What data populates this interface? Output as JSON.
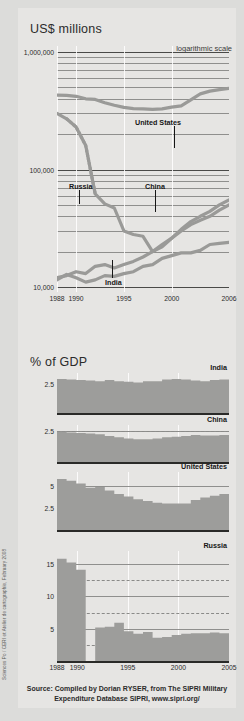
{
  "credit": "Sciences Po / CERI et Atelier de cartographie, February 2008",
  "headings": {
    "usd": "US$ millions",
    "gdp": "% of GDP",
    "log_note": "logarithmic scale"
  },
  "source": {
    "line1": "Source: Compiled by Dorian RYSER, from The SIPRI Military",
    "line2": "Expenditure Database SIPRI, www.sipri.org/"
  },
  "colors": {
    "paper": "#e6e5e3",
    "series_line": "#9a9a98",
    "area_fill": "#9d9d9b",
    "grid": "#8f8f8d",
    "axis": "#2a2a28",
    "text": "#2b2b2b"
  },
  "chart_data": [
    {
      "type": "line",
      "id": "military-expenditure-absolute",
      "title": "US$ millions",
      "annotation": "logarithmic scale",
      "xlabel": "",
      "ylabel": "US$ millions",
      "yscale": "log",
      "ylim": [
        8000,
        1200000
      ],
      "yticks": [
        1000000,
        100000,
        10000
      ],
      "ytick_labels": [
        "1,000,000",
        "100,000",
        "10,000"
      ],
      "xlim": [
        1988,
        2006
      ],
      "xticks": [
        1988,
        1990,
        1995,
        2000,
        2006
      ],
      "xtick_labels": [
        "1988",
        "1990",
        "1995",
        "2000",
        "2006"
      ],
      "grid": true,
      "legend": "inline-labels",
      "series": [
        {
          "name": "United States",
          "x": [
            1988,
            1989,
            1990,
            1991,
            1992,
            1993,
            1994,
            1995,
            1996,
            1997,
            1998,
            1999,
            2000,
            2001,
            2002,
            2003,
            2004,
            2005,
            2006
          ],
          "values": [
            430000,
            428000,
            420000,
            400000,
            395000,
            370000,
            352000,
            338000,
            330000,
            328000,
            325000,
            328000,
            340000,
            348000,
            392000,
            440000,
            465000,
            478000,
            490000
          ]
        },
        {
          "name": "Russia",
          "x": [
            1988,
            1989,
            1990,
            1991,
            1992,
            1993,
            1994,
            1995,
            1996,
            1997,
            1998,
            1999,
            2000,
            2001,
            2002,
            2003,
            2004,
            2005,
            2006
          ],
          "values": [
            300000,
            270000,
            230000,
            160000,
            62000,
            51000,
            47000,
            30000,
            28000,
            27000,
            20000,
            22000,
            26000,
            30000,
            34000,
            37000,
            40000,
            45000,
            50000
          ]
        },
        {
          "name": "China",
          "x": [
            1988,
            1989,
            1990,
            1991,
            1992,
            1993,
            1994,
            1995,
            1996,
            1997,
            1998,
            1999,
            2000,
            2001,
            2002,
            2003,
            2004,
            2005,
            2006
          ],
          "values": [
            12000,
            12500,
            13500,
            13000,
            15000,
            15500,
            14500,
            15500,
            16500,
            18000,
            20000,
            23000,
            26000,
            31000,
            36000,
            40000,
            44000,
            50000,
            55000
          ]
        },
        {
          "name": "India",
          "x": [
            1988,
            1989,
            1990,
            1991,
            1992,
            1993,
            1994,
            1995,
            1996,
            1997,
            1998,
            1999,
            2000,
            2001,
            2002,
            2003,
            2004,
            2005,
            2006
          ],
          "values": [
            11500,
            12800,
            12000,
            11000,
            11500,
            12500,
            12300,
            13000,
            13500,
            15000,
            15500,
            17500,
            18500,
            19500,
            19500,
            20500,
            23000,
            23500,
            24000
          ]
        }
      ]
    },
    {
      "type": "area",
      "id": "gdp-india",
      "title": "India",
      "ylim": [
        0,
        3.4
      ],
      "yticks": [
        2.5
      ],
      "ytick_labels": [
        "2.5"
      ],
      "xlim": [
        1988,
        2005
      ],
      "grid": true,
      "categories": [
        1988,
        1989,
        1990,
        1991,
        1992,
        1993,
        1994,
        1995,
        1996,
        1997,
        1998,
        1999,
        2000,
        2001,
        2002,
        2003,
        2004,
        2005
      ],
      "values": [
        2.9,
        2.85,
        2.8,
        2.75,
        2.7,
        2.8,
        2.7,
        2.65,
        2.6,
        2.7,
        2.7,
        2.85,
        2.9,
        2.85,
        2.75,
        2.7,
        2.8,
        2.85
      ]
    },
    {
      "type": "area",
      "id": "gdp-china",
      "title": "China",
      "ylim": [
        0,
        3.0
      ],
      "yticks": [
        2.5
      ],
      "ytick_labels": [
        "2.5"
      ],
      "xlim": [
        1988,
        2005
      ],
      "grid": true,
      "categories": [
        1988,
        1989,
        1990,
        1991,
        1992,
        1993,
        1994,
        1995,
        1996,
        1997,
        1998,
        1999,
        2000,
        2001,
        2002,
        2003,
        2004,
        2005
      ],
      "values": [
        2.45,
        2.4,
        2.35,
        2.3,
        2.25,
        2.1,
        2.0,
        1.9,
        1.85,
        1.85,
        1.9,
        2.0,
        2.05,
        2.1,
        2.2,
        2.15,
        2.15,
        2.2
      ]
    },
    {
      "type": "area",
      "id": "gdp-united-states",
      "title": "United States",
      "ylim": [
        0,
        6.6
      ],
      "yticks": [
        5,
        2.5
      ],
      "ytick_labels": [
        "5",
        "2.5"
      ],
      "xlim": [
        1988,
        2005
      ],
      "grid": true,
      "categories": [
        1988,
        1989,
        1990,
        1991,
        1992,
        1993,
        1994,
        1995,
        1996,
        1997,
        1998,
        1999,
        2000,
        2001,
        2002,
        2003,
        2004,
        2005
      ],
      "values": [
        5.8,
        5.6,
        5.3,
        4.8,
        4.9,
        4.5,
        4.1,
        3.8,
        3.5,
        3.3,
        3.1,
        3.0,
        3.0,
        3.0,
        3.4,
        3.7,
        3.9,
        4.1
      ]
    },
    {
      "type": "area",
      "id": "gdp-russia",
      "title": "Russia",
      "ylim": [
        0,
        17
      ],
      "yticks": [
        15,
        10,
        5
      ],
      "ytick_labels": [
        "15",
        "10",
        "5"
      ],
      "dashed_levels": [
        12.5,
        7.5,
        2.5
      ],
      "xlim": [
        1988,
        2005
      ],
      "xticks": [
        1988,
        1990,
        1995,
        2000,
        2005
      ],
      "xtick_labels": [
        "1988",
        "1990",
        "1995",
        "2000",
        "2005"
      ],
      "grid": true,
      "categories": [
        1988,
        1989,
        1990,
        1991,
        1992,
        1993,
        1994,
        1995,
        1996,
        1997,
        1998,
        1999,
        2000,
        2001,
        2002,
        2003,
        2004,
        2005
      ],
      "values": [
        15.8,
        15.2,
        14.1,
        0,
        5.2,
        5.3,
        5.9,
        4.6,
        4.2,
        4.5,
        3.6,
        3.7,
        4.0,
        4.2,
        4.3,
        4.3,
        4.4,
        4.3
      ]
    }
  ]
}
